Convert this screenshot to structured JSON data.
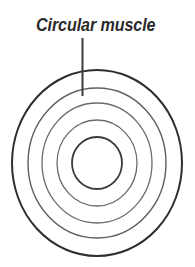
{
  "figure": {
    "width": 195,
    "height": 267,
    "background_color": "#ffffff",
    "title": "Circular muscle",
    "kind": "anatomical-cross-section-diagram"
  },
  "labels": [
    {
      "id": "circular-muscle",
      "text": "Circular muscle",
      "color": "#2b2b2b",
      "x": 36,
      "y": 17,
      "font_size": 17.5,
      "style": "italic"
    }
  ],
  "leader_lines": [
    {
      "id": "circular-muscle-leader",
      "x1": 82.5,
      "y1": 38,
      "x2": 82.5,
      "y2": 96,
      "color": "#3a3a3a",
      "width": 2
    }
  ],
  "diagram": {
    "center_x": 97,
    "center_y": 163,
    "rings": [
      {
        "id": "ring-outer",
        "rx": 85,
        "ry": 93,
        "stroke": "#2e2e2e",
        "stroke_width": 2.0
      },
      {
        "id": "ring-2",
        "rx": 69,
        "ry": 75,
        "stroke": "#5e5e5e",
        "stroke_width": 1.4
      },
      {
        "id": "ring-3",
        "rx": 55,
        "ry": 60,
        "stroke": "#6b6b6b",
        "stroke_width": 1.3
      },
      {
        "id": "ring-4",
        "rx": 40,
        "ry": 43,
        "stroke": "#6b6b6b",
        "stroke_width": 1.3
      },
      {
        "id": "ring-inner",
        "rx": 25,
        "ry": 26,
        "stroke": "#3a3a3a",
        "stroke_width": 1.8
      }
    ],
    "ring_count": 5,
    "fill": "none"
  }
}
